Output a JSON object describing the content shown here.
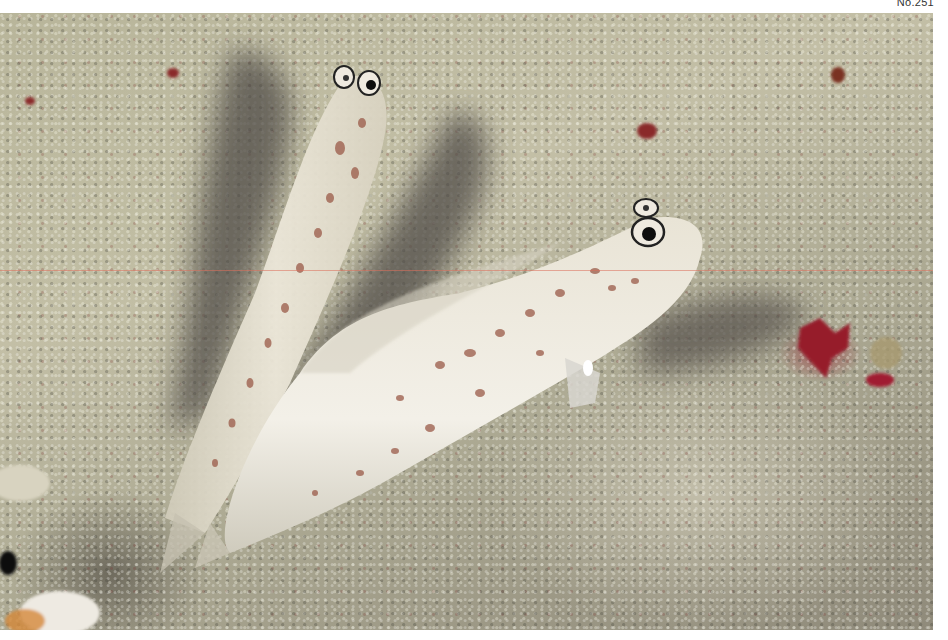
{
  "page": {
    "number_label": "No.251"
  },
  "photo": {
    "subject": "Two shrimp gobies on sandy seabed",
    "elements": [
      "goby-fish-left",
      "goby-fish-right",
      "fish-shadows",
      "sand-seabed",
      "red-algae"
    ],
    "colors": {
      "sand": "#c3bfa6",
      "shadow": "#5e5a55",
      "fish_body": "#eeeae0",
      "fish_spots": "#9a5a48",
      "eye_ring": "#1a1a1a",
      "red_algae": "#96142a",
      "scan_line": "#dc6e5a"
    }
  }
}
